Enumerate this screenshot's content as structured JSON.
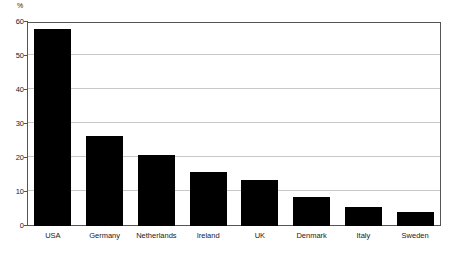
{
  "chart_data": {
    "type": "bar",
    "title": "",
    "subtitle": "",
    "xlabel": "",
    "ylabel": "%",
    "categories": [
      "USA",
      "Germany",
      "Netherlands",
      "Ireland",
      "UK",
      "Denmark",
      "Italy",
      "Sweden"
    ],
    "values": [
      58,
      26.5,
      21,
      16,
      13.5,
      8.5,
      5.5,
      4
    ],
    "ylim": [
      0,
      60
    ],
    "yticks": [
      0,
      10,
      20,
      30,
      40,
      50,
      60
    ],
    "ytick_labels": [
      "0",
      "10",
      "20",
      "30",
      "40",
      "50",
      "60"
    ],
    "grid": true,
    "grid_axis": "y",
    "legend": false,
    "legend_position": "none",
    "bar_color": "#000000",
    "grid_color": "#c8c8c8",
    "frame_color": "#555555",
    "background_color": "#ffffff"
  }
}
